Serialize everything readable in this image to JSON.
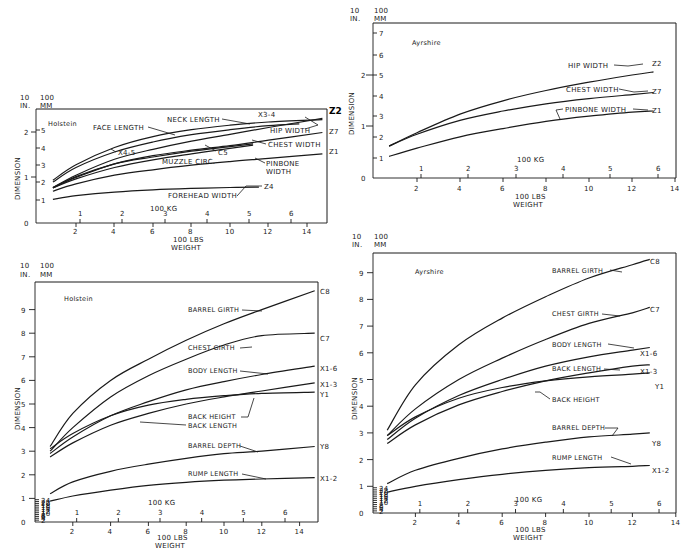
{
  "chart_data": [
    {
      "id": "holstein_widths",
      "type": "line",
      "title": "Holstein",
      "xlabel": "100 LBS WEIGHT",
      "x2label": "100 KG",
      "ylabel": "DIMENSION",
      "y_units_left": "10 IN.",
      "y_units_right": "100 MM",
      "xlim": [
        0,
        15
      ],
      "xticks": [
        2,
        4,
        6,
        8,
        10,
        12,
        14
      ],
      "kg_ticks": [
        1,
        2,
        3,
        4,
        5,
        6
      ],
      "y_in_ticks": [
        0,
        1,
        2
      ],
      "y_mm_ticks": [
        1,
        2,
        3,
        4,
        5
      ],
      "grid": false,
      "series": [
        {
          "name": "NECK LENGTH",
          "code": "X3-4",
          "x": [
            0.8,
            2,
            4,
            6,
            8,
            10,
            12,
            14.8
          ],
          "y_in": [
            0.94,
            1.28,
            1.66,
            1.9,
            2.05,
            2.15,
            2.22,
            2.27
          ]
        },
        {
          "name": "FACE LENGTH",
          "code": "",
          "x": [
            0.8,
            2,
            4,
            6,
            8,
            10,
            12,
            13.6
          ],
          "y_in": [
            0.9,
            1.22,
            1.56,
            1.78,
            1.94,
            2.05,
            2.14,
            2.18
          ]
        },
        {
          "name": "HIP WIDTH",
          "code": "Z2",
          "x": [
            0.8,
            2,
            4,
            6,
            8,
            10,
            12,
            14.8
          ],
          "y_in": [
            0.78,
            1.05,
            1.4,
            1.62,
            1.8,
            1.95,
            2.1,
            2.3
          ]
        },
        {
          "name": "CHEST WIDTH",
          "code": "Z7",
          "x": [
            0.8,
            2,
            4,
            6,
            8,
            10,
            12,
            14.8
          ],
          "y_in": [
            0.77,
            1.02,
            1.3,
            1.48,
            1.6,
            1.7,
            1.82,
            1.99
          ]
        },
        {
          "name": "X4-5",
          "code": "X4-5",
          "x": [
            0.8,
            2,
            4,
            6,
            8,
            10,
            11.2
          ],
          "y_in": [
            0.78,
            1.0,
            1.3,
            1.45,
            1.58,
            1.68,
            1.74
          ]
        },
        {
          "name": "MUZZLE CIRC.",
          "code": "C5",
          "x": [
            0.8,
            2,
            4,
            6,
            8,
            10,
            11.2
          ],
          "y_in": [
            0.77,
            0.97,
            1.22,
            1.39,
            1.52,
            1.64,
            1.71
          ]
        },
        {
          "name": "PINBONE WIDTH",
          "code": "Z1",
          "x": [
            0.8,
            2,
            4,
            6,
            8,
            10,
            12,
            14.8
          ],
          "y_in": [
            0.7,
            0.86,
            1.05,
            1.17,
            1.27,
            1.35,
            1.42,
            1.52
          ]
        },
        {
          "name": "FOREHEAD WIDTH",
          "code": "Z4",
          "x": [
            0.8,
            2,
            4,
            6,
            8,
            10,
            11.5
          ],
          "y_in": [
            0.52,
            0.6,
            0.68,
            0.73,
            0.76,
            0.78,
            0.79
          ]
        }
      ]
    },
    {
      "id": "ayrshire_widths",
      "type": "line",
      "title": "Ayrshire",
      "xlabel": "100 LBS WEIGHT",
      "x2label": "100 KG",
      "ylabel": "DIMENSION",
      "y_units_left": "10 IN.",
      "y_units_right": "100 MM",
      "xlim": [
        0,
        14
      ],
      "xticks": [
        2,
        4,
        6,
        8,
        10,
        12,
        14
      ],
      "kg_ticks": [
        1,
        2,
        3,
        4,
        5,
        6
      ],
      "y_in_ticks": [
        0,
        1,
        2
      ],
      "y_mm_ticks": [
        1,
        2,
        3,
        4,
        5,
        6,
        7
      ],
      "grid": false,
      "series": [
        {
          "name": "HIP WIDTH",
          "code": "Z2",
          "x": [
            0.7,
            2,
            4,
            6,
            8,
            10,
            12,
            13
          ],
          "y_in": [
            0.62,
            0.88,
            1.24,
            1.5,
            1.7,
            1.86,
            2.0,
            2.06
          ]
        },
        {
          "name": "CHEST WIDTH",
          "code": "Z7",
          "x": [
            0.7,
            2,
            4,
            6,
            8,
            10,
            12,
            13
          ],
          "y_in": [
            0.62,
            0.85,
            1.12,
            1.3,
            1.44,
            1.54,
            1.62,
            1.66
          ]
        },
        {
          "name": "PINBONE WIDTH",
          "code": "Z1",
          "x": [
            0.7,
            2,
            4,
            6,
            8,
            10,
            12,
            13
          ],
          "y_in": [
            0.42,
            0.58,
            0.8,
            0.96,
            1.1,
            1.2,
            1.28,
            1.3
          ]
        }
      ]
    },
    {
      "id": "holstein_lengths",
      "type": "line",
      "title": "Holstein",
      "xlabel": "100 LBS WEIGHT",
      "x2label": "100 KG",
      "ylabel": "DIMENSION",
      "y_units_left": "10 IN.",
      "y_units_right": "100 MM",
      "xlim": [
        0,
        15
      ],
      "xticks": [
        2,
        4,
        6,
        8,
        10,
        12,
        14
      ],
      "kg_ticks": [
        1,
        2,
        3,
        4,
        5,
        6
      ],
      "y_in_ticks": [
        0,
        1,
        2,
        3,
        4,
        5,
        6,
        7,
        8,
        9
      ],
      "y_mm_ticks": [
        2,
        4,
        6,
        8,
        10,
        12,
        14,
        16,
        18,
        20,
        22,
        24
      ],
      "grid": false,
      "series": [
        {
          "name": "BARREL GIRTH",
          "code": "C8",
          "x": [
            0.8,
            2,
            4,
            6,
            8,
            10,
            12,
            14.8
          ],
          "y_in": [
            3.2,
            4.6,
            6.0,
            6.9,
            7.7,
            8.4,
            9.0,
            9.8
          ]
        },
        {
          "name": "CHEST GIRTH",
          "code": "C7",
          "x": [
            0.8,
            2,
            4,
            6,
            8,
            10,
            12,
            14.8
          ],
          "y_in": [
            3.0,
            4.0,
            5.3,
            6.2,
            6.9,
            7.5,
            7.9,
            8.0
          ]
        },
        {
          "name": "BODY LENGTH",
          "code": "X1-6",
          "x": [
            0.8,
            2,
            4,
            6,
            8,
            10,
            12,
            14.8
          ],
          "y_in": [
            2.9,
            3.6,
            4.5,
            5.1,
            5.6,
            5.95,
            6.25,
            6.6
          ]
        },
        {
          "name": "BACK LENGTH",
          "code": "X1-3",
          "x": [
            0.8,
            2,
            4,
            6,
            8,
            10,
            12,
            14.8
          ],
          "y_in": [
            2.75,
            3.35,
            4.1,
            4.6,
            5.0,
            5.3,
            5.55,
            5.9
          ]
        },
        {
          "name": "BACK HEIGHT",
          "code": "Y1",
          "x": [
            0.8,
            2,
            4,
            6,
            8,
            10,
            12,
            14.8
          ],
          "y_in": [
            3.1,
            3.75,
            4.5,
            4.95,
            5.2,
            5.35,
            5.45,
            5.5
          ]
        },
        {
          "name": "BARREL DEPTH",
          "code": "Y8",
          "x": [
            0.8,
            2,
            4,
            6,
            8,
            10,
            12,
            14.8
          ],
          "y_in": [
            1.2,
            1.7,
            2.15,
            2.45,
            2.7,
            2.9,
            3.0,
            3.2
          ]
        },
        {
          "name": "RUMP LENGTH",
          "code": "X1-2",
          "x": [
            0.8,
            2,
            4,
            6,
            8,
            10,
            12,
            14.8
          ],
          "y_in": [
            0.88,
            1.1,
            1.35,
            1.55,
            1.68,
            1.77,
            1.82,
            1.88
          ]
        }
      ]
    },
    {
      "id": "ayrshire_lengths",
      "type": "line",
      "title": "Ayrshire",
      "xlabel": "100 LBS WEIGHT",
      "x2label": "100 KG",
      "ylabel": "DIMENSION",
      "y_units_left": "10 IN.",
      "y_units_right": "100 MM",
      "xlim": [
        0,
        14
      ],
      "xticks": [
        2,
        4,
        6,
        8,
        10,
        12,
        14
      ],
      "kg_ticks": [
        1,
        2,
        3,
        4,
        5,
        6
      ],
      "y_in_ticks": [
        0,
        1,
        2,
        3,
        4,
        5,
        6,
        7,
        8,
        9
      ],
      "y_mm_ticks": [
        2,
        4,
        6,
        8,
        10,
        12,
        14,
        16,
        18,
        20,
        22,
        24
      ],
      "grid": false,
      "series": [
        {
          "name": "BARREL GIRTH",
          "code": "C8",
          "x": [
            0.7,
            2,
            4,
            6,
            8,
            10,
            12,
            12.8
          ],
          "y_in": [
            3.1,
            4.8,
            6.3,
            7.3,
            8.1,
            8.8,
            9.3,
            9.5
          ]
        },
        {
          "name": "CHEST GIRTH",
          "code": "C7",
          "x": [
            0.7,
            2,
            4,
            6,
            8,
            10,
            12,
            12.8
          ],
          "y_in": [
            2.9,
            3.9,
            5.0,
            5.8,
            6.5,
            7.1,
            7.5,
            7.7
          ]
        },
        {
          "name": "BODY LENGTH",
          "code": "X1-6",
          "x": [
            0.7,
            2,
            4,
            6,
            8,
            10,
            12,
            12.8
          ],
          "y_in": [
            2.75,
            3.55,
            4.4,
            5.0,
            5.5,
            5.85,
            6.1,
            6.2
          ]
        },
        {
          "name": "BACK LENGTH",
          "code": "X1-3",
          "x": [
            0.7,
            2,
            4,
            6,
            8,
            10,
            12,
            12.8
          ],
          "y_in": [
            2.6,
            3.3,
            4.05,
            4.55,
            4.95,
            5.25,
            5.5,
            5.55
          ]
        },
        {
          "name": "BACK HEIGHT",
          "code": "Y1",
          "x": [
            0.7,
            2,
            4,
            6,
            8,
            10,
            12,
            12.8
          ],
          "y_in": [
            2.9,
            3.6,
            4.3,
            4.7,
            4.95,
            5.1,
            5.2,
            5.25
          ]
        },
        {
          "name": "BARREL DEPTH",
          "code": "Y8",
          "x": [
            0.7,
            2,
            4,
            6,
            8,
            10,
            12,
            12.8
          ],
          "y_in": [
            1.1,
            1.6,
            2.05,
            2.4,
            2.65,
            2.85,
            2.95,
            3.0
          ]
        },
        {
          "name": "RUMP LENGTH",
          "code": "X1-2",
          "x": [
            0.7,
            2,
            4,
            6,
            8,
            10,
            12,
            12.8
          ],
          "y_in": [
            0.78,
            1.0,
            1.25,
            1.45,
            1.6,
            1.7,
            1.75,
            1.78
          ]
        }
      ]
    }
  ],
  "charts": {
    "c1": {
      "breed": "Holstein",
      "units_in": "10",
      "units_in2": "IN.",
      "units_mm": "100",
      "units_mm2": "MM",
      "ylabel": "DIMENSION",
      "kg": "100 KG",
      "lbs": "100 LBS",
      "weight": "WEIGHT",
      "labels": {
        "neck": "NECK LENGTH",
        "x34": "X3-4",
        "face": "FACE LENGTH",
        "hip": "HIP WIDTH",
        "z2": "Z2",
        "z7": "Z7",
        "chest": "CHEST WIDTH",
        "x45": "X4-5",
        "c5": "C5",
        "muzzle": "MUZZLE CIRC.",
        "z1": "Z1",
        "pin1": "PINBONE",
        "pin2": "WIDTH",
        "z4": "Z4",
        "fore": "FOREHEAD WIDTH"
      }
    },
    "c2": {
      "breed": "Ayrshire",
      "units_in": "10",
      "units_in2": "IN.",
      "units_mm": "100",
      "units_mm2": "MM",
      "ylabel": "DIMENSION",
      "kg": "100 KG",
      "lbs": "100 LBS",
      "weight": "WEIGHT",
      "labels": {
        "hip": "HIP WIDTH",
        "z2": "Z2",
        "chest": "CHEST WIDTH",
        "z7": "Z7",
        "pin": "PINBONE WIDTH",
        "z1": "Z1"
      }
    },
    "c3": {
      "breed": "Holstein",
      "units_in": "10",
      "units_in2": "IN.",
      "units_mm": "100",
      "units_mm2": "MM",
      "ylabel": "DIMENSION",
      "kg": "100 KG",
      "lbs": "100 LBS",
      "weight": "WEIGHT",
      "labels": {
        "bg": "BARREL GIRTH",
        "c8": "C8",
        "cg": "CHEST GIRTH",
        "c7": "C7",
        "bl": "BODY LENGTH",
        "x16": "X1-6",
        "x13": "X1-3",
        "y1": "Y1",
        "bh": "BACK HEIGHT",
        "bkl": "BACK LENGTH",
        "bd": "BARREL DEPTH",
        "y8": "Y8",
        "rl": "RUMP LENGTH",
        "x12": "X1-2"
      }
    },
    "c4": {
      "breed": "Ayrshire",
      "units_in": "10",
      "units_in2": "IN.",
      "units_mm": "100",
      "units_mm2": "MM",
      "ylabel": "DIMENSION",
      "kg": "100 KG",
      "lbs": "100 LBS",
      "weight": "WEIGHT",
      "labels": {
        "bg": "BARREL GIRTH",
        "c8": "C8",
        "cg": "CHEST GIRTH",
        "c7": "C7",
        "bl": "BODY LENGTH",
        "x16": "X1-6",
        "bkl": "BACK LENGTH",
        "x13": "X1-3",
        "y1": "Y1",
        "bh": "BACK HEIGHT",
        "bd": "BARREL DEPTH",
        "y8": "Y8",
        "rl": "RUMP LENGTH",
        "x12": "X1-2"
      }
    }
  }
}
